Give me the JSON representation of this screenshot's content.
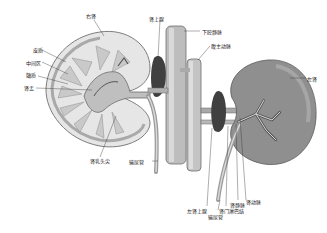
{
  "figure": {
    "background": "#ffffff",
    "colors": {
      "kidney_section_fill": "#e6e6e6",
      "cortex_stroke": "#8a8a8a",
      "medulla_fill": "#c8c8c8",
      "vessel_fill": "#b9b9b9",
      "vessel_shade": "#6e6e6e",
      "left_kidney_fill": "#8f8f8f",
      "adrenal_fill": "#3f3f3f",
      "label_color": "#222222"
    }
  },
  "labels": {
    "right_kidney": "右肾",
    "cortex": "皮质",
    "intermediate_zone": "中间区",
    "medulla": "髓质",
    "renal_pelvis": "肾盂",
    "right_adrenal": "肾上腺",
    "inferior_vena_cava": "下腔静脉",
    "abdominal_aorta": "腹主动脉",
    "left_kidney": "左肾",
    "renal_papilla": "肾乳头尖",
    "ureter_right": "输尿管",
    "left_adrenal": "左肾上腺",
    "ureter_left": "输尿管",
    "hilar_lymph_node": "肾门淋巴结",
    "renal_vein": "肾静脉",
    "renal_artery": "肾动脉"
  }
}
